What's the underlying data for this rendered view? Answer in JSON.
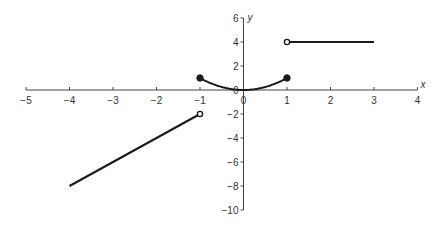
{
  "chart_data": {
    "type": "line",
    "title": "",
    "xlabel": "x",
    "ylabel": "y",
    "xlim": [
      -5,
      4
    ],
    "ylim": [
      -10,
      6
    ],
    "x_ticks": [
      -5,
      -4,
      -3,
      -2,
      -1,
      0,
      1,
      2,
      3,
      4
    ],
    "x_tick_labels": [
      "−5",
      "−4",
      "−3",
      "−2",
      "−1",
      "0",
      "1",
      "2",
      "3",
      "4"
    ],
    "y_ticks": [
      6,
      4,
      2,
      0,
      -2,
      -4,
      -6,
      -8,
      -10
    ],
    "y_tick_labels": [
      "6",
      "4",
      "2",
      "0",
      "−2",
      "−4",
      "−6",
      "−8",
      "−10"
    ],
    "grid": false,
    "legend": null,
    "line_color": "#1a1a1a",
    "series": [
      {
        "name": "piece-1 linear",
        "domain": "-4 <= x < -1",
        "points": [
          [
            -4,
            -8
          ],
          [
            -1,
            -2
          ]
        ],
        "endpoints": [
          {
            "x": -4,
            "y": -8,
            "marker": "none"
          },
          {
            "x": -1,
            "y": -2,
            "marker": "open"
          }
        ]
      },
      {
        "name": "piece-2 quadratic",
        "domain": "-1 <= x <= 1",
        "formula": "y = x^2",
        "points": [
          [
            -1,
            1
          ],
          [
            -0.5,
            0.25
          ],
          [
            0,
            0
          ],
          [
            0.5,
            0.25
          ],
          [
            1,
            1
          ]
        ],
        "endpoints": [
          {
            "x": -1,
            "y": 1,
            "marker": "closed"
          },
          {
            "x": 1,
            "y": 1,
            "marker": "closed"
          }
        ]
      },
      {
        "name": "piece-3 constant",
        "domain": "1 < x <= 3",
        "points": [
          [
            1,
            4
          ],
          [
            3,
            4
          ]
        ],
        "endpoints": [
          {
            "x": 1,
            "y": 4,
            "marker": "open"
          },
          {
            "x": 3,
            "y": 4,
            "marker": "none"
          }
        ]
      }
    ]
  }
}
